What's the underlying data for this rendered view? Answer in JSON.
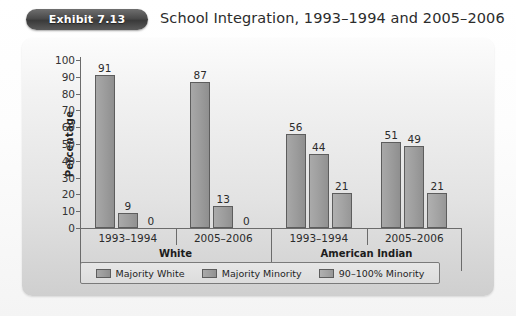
{
  "header": {
    "badge_label": "Exhibit 7.13",
    "title": "School Integration, 1993–1994 and 2005–2006"
  },
  "chart_data": {
    "type": "bar",
    "title": "School Integration, 1993–1994 and 2005–2006",
    "xlabel": "",
    "ylabel": "Percentage",
    "ylim": [
      0,
      100
    ],
    "ytick_step": 10,
    "yticks": [
      "100",
      "90",
      "80",
      "70",
      "60",
      "50",
      "40",
      "30",
      "20",
      "10",
      "0"
    ],
    "grid": false,
    "legend_position": "bottom",
    "categories": [
      "1993–1994",
      "2005–2006",
      "1993–1994",
      "2005–2006"
    ],
    "group_labels": [
      "White",
      "American Indian"
    ],
    "series": [
      {
        "name": "Majority White",
        "color": "#9b9b9b",
        "values": [
          91,
          87,
          56,
          51
        ]
      },
      {
        "name": "Majority Minority",
        "color": "#9d9d9d",
        "values": [
          9,
          13,
          44,
          49
        ]
      },
      {
        "name": "90–100% Minority",
        "color": "#a3a3a3",
        "values": [
          0,
          0,
          21,
          21
        ]
      }
    ]
  }
}
